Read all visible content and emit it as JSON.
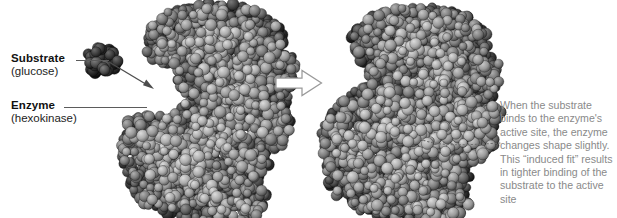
{
  "figure": {
    "background_color": "#ffffff"
  },
  "labels": {
    "substrate": {
      "title": "Substrate",
      "subtitle": "(glucose)",
      "color": "#111111"
    },
    "enzyme": {
      "title": "Enzyme",
      "subtitle": "(hexokinase)",
      "color": "#111111"
    }
  },
  "note": {
    "color": "#8a8a8a",
    "lines": [
      "When the substrate",
      "binds to the enzyme's",
      "active site, the enzyme",
      "changes shape slightly.",
      "This “induced fit” results",
      "in tighter binding of the",
      "substrate to the active site"
    ]
  },
  "connectors": {
    "substrate_leader": "leader-line",
    "enzyme_leader": "leader-line",
    "binding_arrow": "arrow-icon",
    "transition_arrow": "right-arrow-icon",
    "active_site_pointer": "dotted-leader-line"
  },
  "molecules": {
    "glucose": {
      "name": "glucose-substrate-model",
      "atom_count": 7,
      "style": "space-filling",
      "tone": "dark"
    },
    "hexokinase_open": {
      "name": "hexokinase-open-model",
      "style": "space-filling",
      "state": "unbound"
    },
    "hexokinase_closed": {
      "name": "hexokinase-closed-model",
      "style": "space-filling",
      "state": "substrate-bound"
    }
  }
}
